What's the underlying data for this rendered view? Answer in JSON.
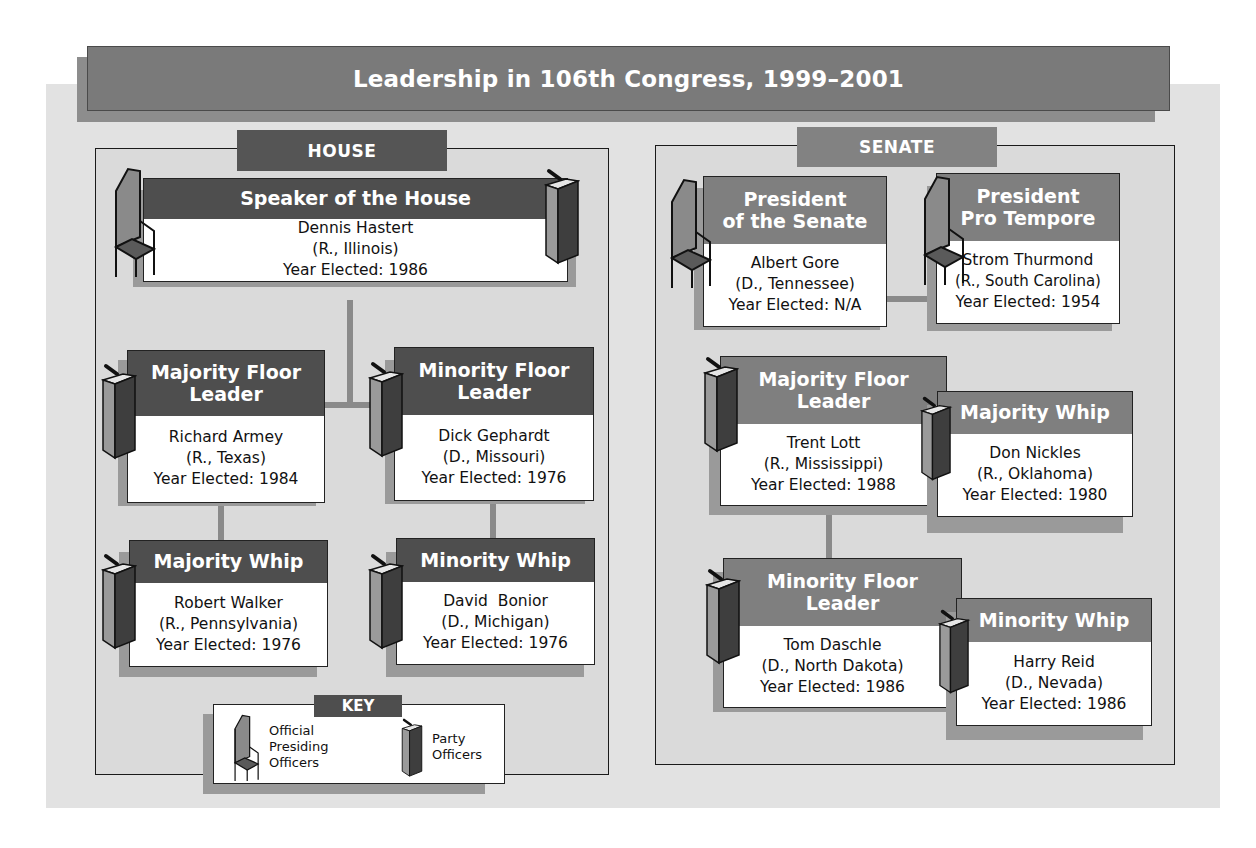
{
  "title": "Leadership in 106th Congress, 1999–2001",
  "colors": {
    "house_header": "#4e4e4e",
    "senate_header": "#7f7f7f",
    "panel_bg": "#e2e2e2",
    "title_bg": "#7a7a7a"
  },
  "house": {
    "label": "HOUSE",
    "speaker": {
      "title": "Speaker of the House",
      "name": "Dennis Hastert",
      "party_state": "(R., Illinois)",
      "year": "Year Elected: 1986",
      "icons": [
        "chair-icon",
        "podium-icon"
      ]
    },
    "majority_leader": {
      "title_line1": "Majority Floor",
      "title_line2": "Leader",
      "name": "Richard Armey",
      "party_state": "(R., Texas)",
      "year": "Year Elected: 1984",
      "icons": [
        "podium-icon"
      ]
    },
    "minority_leader": {
      "title_line1": "Minority Floor",
      "title_line2": "Leader",
      "name": "Dick Gephardt",
      "party_state": "(D., Missouri)",
      "year": "Year Elected: 1976",
      "icons": [
        "podium-icon"
      ]
    },
    "majority_whip": {
      "title": "Majority Whip",
      "name": "Robert Walker",
      "party_state": "(R., Pennsylvania)",
      "year": "Year Elected: 1976",
      "icons": [
        "podium-icon"
      ]
    },
    "minority_whip": {
      "title": "Minority Whip",
      "name": "David  Bonior",
      "party_state": "(D., Michigan)",
      "year": "Year Elected: 1976",
      "icons": [
        "podium-icon"
      ]
    }
  },
  "senate": {
    "label": "SENATE",
    "president": {
      "title_line1": "President",
      "title_line2": "of the Senate",
      "name": "Albert Gore",
      "party_state": "(D., Tennessee)",
      "year": "Year Elected: N/A",
      "icons": [
        "chair-icon"
      ]
    },
    "pro_tempore": {
      "title_line1": "President",
      "title_line2": "Pro Tempore",
      "name": "Strom Thurmond",
      "party_state": "(R., South Carolina)",
      "year": "Year Elected: 1954",
      "icons": [
        "chair-icon"
      ]
    },
    "majority_leader": {
      "title_line1": "Majority Floor",
      "title_line2": "Leader",
      "name": "Trent Lott",
      "party_state": "(R., Mississippi)",
      "year": "Year Elected: 1988",
      "icons": [
        "podium-icon"
      ]
    },
    "majority_whip": {
      "title": "Majority Whip",
      "name": "Don Nickles",
      "party_state": "(R., Oklahoma)",
      "year": "Year Elected: 1980",
      "icons": [
        "podium-icon"
      ]
    },
    "minority_leader": {
      "title_line1": "Minority Floor",
      "title_line2": "Leader",
      "name": "Tom Daschle",
      "party_state": "(D., North Dakota)",
      "year": "Year Elected: 1986",
      "icons": [
        "podium-icon"
      ]
    },
    "minority_whip": {
      "title": "Minority Whip",
      "name": "Harry Reid",
      "party_state": "(D., Nevada)",
      "year": "Year Elected: 1986",
      "icons": [
        "podium-icon"
      ]
    }
  },
  "key": {
    "label": "KEY",
    "items": [
      {
        "icon": "chair-icon",
        "line1": "Official",
        "line2": "Presiding",
        "line3": "Officers"
      },
      {
        "icon": "podium-icon",
        "line1": "Party",
        "line2": "Officers"
      }
    ]
  }
}
